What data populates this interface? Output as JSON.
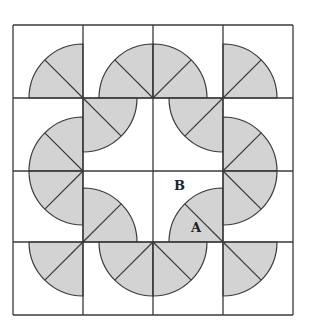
{
  "diagram": {
    "colors": {
      "background": "#ffffff",
      "fill": "#d3d3d3",
      "stroke": "#3a3a3a"
    },
    "grid": {
      "rows": 4,
      "cols": 4,
      "x_lines": [
        13,
        83,
        153,
        223,
        293
      ],
      "y_lines": [
        25,
        98,
        171,
        242,
        315
      ]
    },
    "radius": 54,
    "quarters": [
      {
        "row": 0,
        "col": 0,
        "cx": 83,
        "cy": 98,
        "quadrant": "upper-left"
      },
      {
        "row": 0,
        "col": 1,
        "cx": 153,
        "cy": 98,
        "quadrant": "upper-left"
      },
      {
        "row": 0,
        "col": 2,
        "cx": 153,
        "cy": 98,
        "quadrant": "upper-right"
      },
      {
        "row": 0,
        "col": 3,
        "cx": 223,
        "cy": 98,
        "quadrant": "upper-right"
      },
      {
        "row": 1,
        "col": 0,
        "cx": 83,
        "cy": 171,
        "quadrant": "upper-left"
      },
      {
        "row": 1,
        "col": 1,
        "cx": 83,
        "cy": 98,
        "quadrant": "lower-right"
      },
      {
        "row": 1,
        "col": 2,
        "cx": 223,
        "cy": 98,
        "quadrant": "lower-left"
      },
      {
        "row": 1,
        "col": 3,
        "cx": 223,
        "cy": 171,
        "quadrant": "upper-right"
      },
      {
        "row": 2,
        "col": 0,
        "cx": 83,
        "cy": 171,
        "quadrant": "lower-left"
      },
      {
        "row": 2,
        "col": 1,
        "cx": 83,
        "cy": 242,
        "quadrant": "upper-right"
      },
      {
        "row": 2,
        "col": 2,
        "cx": 223,
        "cy": 242,
        "quadrant": "upper-left"
      },
      {
        "row": 2,
        "col": 3,
        "cx": 223,
        "cy": 171,
        "quadrant": "lower-right"
      },
      {
        "row": 3,
        "col": 0,
        "cx": 83,
        "cy": 242,
        "quadrant": "lower-left"
      },
      {
        "row": 3,
        "col": 1,
        "cx": 153,
        "cy": 242,
        "quadrant": "lower-left"
      },
      {
        "row": 3,
        "col": 2,
        "cx": 153,
        "cy": 242,
        "quadrant": "lower-right"
      },
      {
        "row": 3,
        "col": 3,
        "cx": 223,
        "cy": 242,
        "quadrant": "lower-right"
      }
    ],
    "labels": [
      {
        "text": "B",
        "x": 174,
        "y": 190
      },
      {
        "text": "A",
        "x": 191,
        "y": 232
      }
    ]
  }
}
